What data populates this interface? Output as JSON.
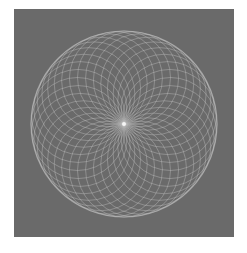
{
  "image": {
    "description": "Grayscale circular rosette of overlapping circles through a common center",
    "frame": {
      "x": 14,
      "y": 9,
      "width": 220,
      "height": 228
    },
    "background_color": "#6a6a6a",
    "page_color": "#ffffff",
    "line_color": "#c4c4c4",
    "line_opacity": 0.45,
    "center": {
      "x": 110,
      "y": 115
    },
    "outer_radius": 93,
    "circle_count": 36,
    "center_dot_color": "#ffffff"
  }
}
